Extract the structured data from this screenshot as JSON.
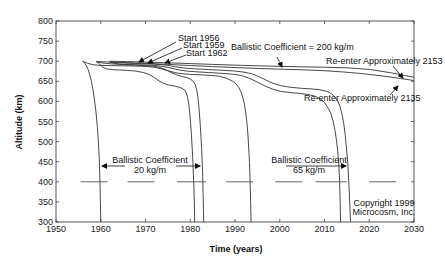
{
  "chart_data": {
    "type": "line",
    "title": "",
    "xlabel": "Time (years)",
    "ylabel": "Altitude (km)",
    "xlim": [
      1950,
      2030
    ],
    "ylim": [
      300,
      800
    ],
    "xticks": [
      1950,
      1960,
      1970,
      1980,
      1990,
      2000,
      2010,
      2020,
      2030
    ],
    "yticks": [
      300,
      350,
      400,
      450,
      500,
      550,
      600,
      650,
      700,
      750,
      800
    ],
    "grid": false,
    "legend": null,
    "series": [
      {
        "name": "BC 20 kg/m, start 1956",
        "points": [
          [
            1956,
            700
          ],
          [
            1956.8,
            690
          ],
          [
            1957.5,
            670
          ],
          [
            1958.3,
            630
          ],
          [
            1959,
            570
          ],
          [
            1959.5,
            500
          ],
          [
            1959.8,
            420
          ],
          [
            1960,
            300
          ]
        ]
      },
      {
        "name": "BC 20 kg/m, start 1959",
        "points": [
          [
            1959,
            700
          ],
          [
            1960,
            690
          ],
          [
            1961,
            680
          ],
          [
            1964,
            678
          ],
          [
            1968,
            676
          ],
          [
            1971,
            668
          ],
          [
            1973,
            650
          ],
          [
            1975,
            640
          ],
          [
            1978,
            636
          ],
          [
            1979.5,
            620
          ],
          [
            1980.3,
            520
          ],
          [
            1980.8,
            400
          ],
          [
            1981,
            300
          ]
        ]
      },
      {
        "name": "BC 20 kg/m, start 1962",
        "points": [
          [
            1962,
            698
          ],
          [
            1964,
            692
          ],
          [
            1968,
            690
          ],
          [
            1972,
            688
          ],
          [
            1974,
            682
          ],
          [
            1976,
            670
          ],
          [
            1978,
            662
          ],
          [
            1980,
            658
          ],
          [
            1981.5,
            640
          ],
          [
            1982.3,
            540
          ],
          [
            1982.8,
            420
          ],
          [
            1983,
            300
          ]
        ]
      },
      {
        "name": "BC 65 kg/m, start 1956",
        "points": [
          [
            1956,
            700
          ],
          [
            1958,
            690
          ],
          [
            1962,
            689
          ],
          [
            1968,
            688
          ],
          [
            1972,
            686
          ],
          [
            1975,
            676
          ],
          [
            1978,
            668
          ],
          [
            1985,
            665
          ],
          [
            1988,
            660
          ],
          [
            1991,
            640
          ],
          [
            1992.5,
            580
          ],
          [
            1993.3,
            450
          ],
          [
            1993.6,
            300
          ]
        ]
      },
      {
        "name": "BC 65 kg/m, start 1959",
        "points": [
          [
            1959,
            698
          ],
          [
            1962,
            693
          ],
          [
            1968,
            691
          ],
          [
            1972,
            690
          ],
          [
            1975,
            685
          ],
          [
            1978,
            676
          ],
          [
            1984,
            672
          ],
          [
            1990,
            668
          ],
          [
            1993,
            660
          ],
          [
            1997,
            636
          ],
          [
            2000,
            624
          ],
          [
            2005,
            620
          ],
          [
            2008,
            614
          ],
          [
            2010,
            600
          ],
          [
            2012,
            560
          ],
          [
            2013.3,
            450
          ],
          [
            2013.6,
            300
          ]
        ]
      },
      {
        "name": "BC 65 kg/m, start 1962",
        "points": [
          [
            1962,
            697
          ],
          [
            1968,
            694
          ],
          [
            1972,
            693
          ],
          [
            1975,
            690
          ],
          [
            1978,
            683
          ],
          [
            1984,
            679
          ],
          [
            1990,
            676
          ],
          [
            1994,
            670
          ],
          [
            1997,
            652
          ],
          [
            2000,
            638
          ],
          [
            2005,
            632
          ],
          [
            2009,
            630
          ],
          [
            2012,
            620
          ],
          [
            2014,
            580
          ],
          [
            2015.3,
            450
          ],
          [
            2015.8,
            300
          ]
        ]
      },
      {
        "name": "BC 200 kg/m, upper (re-enter ~2153)",
        "points": [
          [
            1962,
            700
          ],
          [
            1970,
            698
          ],
          [
            1980,
            694
          ],
          [
            1990,
            690
          ],
          [
            2000,
            687
          ],
          [
            2010,
            685
          ],
          [
            2020,
            682
          ],
          [
            2030,
            660
          ]
        ]
      },
      {
        "name": "BC 200 kg/m, lower (re-enter ~2135)",
        "points": [
          [
            1959,
            699
          ],
          [
            1970,
            695
          ],
          [
            1980,
            689
          ],
          [
            1990,
            684
          ],
          [
            2000,
            680
          ],
          [
            2010,
            677
          ],
          [
            2018,
            670
          ],
          [
            2024,
            662
          ],
          [
            2030,
            652
          ]
        ]
      }
    ],
    "annotations": [
      {
        "text": "Start 1956",
        "x": 1962,
        "y": 722
      },
      {
        "text": "Start 1959",
        "x": 1964,
        "y": 711
      },
      {
        "text": "Start 1962",
        "x": 1967,
        "y": 700
      },
      {
        "text": "Ballistic Coefficient = 200 kg/m",
        "x": 1982,
        "y": 717
      },
      {
        "text": "Re-enter Approximately 2153",
        "x": 1998,
        "y": 689
      },
      {
        "text": "Re-enter Approximately 2135",
        "x": 2000,
        "y": 615
      },
      {
        "text": "Ballistic Coefficient",
        "x": 1967,
        "y": 438
      },
      {
        "text": "20 kg/m",
        "x": 1967,
        "y": 425
      },
      {
        "text": "Ballistic Coefficient",
        "x": 2002,
        "y": 438
      },
      {
        "text": "65 kg/m",
        "x": 2002,
        "y": 425
      },
      {
        "text": "Copyright 1999",
        "x": 2025,
        "y": 335
      },
      {
        "text": "Microcosm, Inc.",
        "x": 2025,
        "y": 322
      }
    ],
    "reference_dashes_y": 400
  },
  "labels": {
    "xlabel": "Time (years)",
    "ylabel": "Altitude (km)",
    "start_1956": "Start 1956",
    "start_1959": "Start 1959",
    "start_1962": "Start 1962",
    "bc_200": "Ballistic Coefficient = 200 kg/m",
    "reenter_2153": "Re-enter Approximately 2153",
    "reenter_2135": "Re-enter Approximately 2135",
    "bc_label": "Ballistic Coefficient",
    "bc_20": "20 kg/m",
    "bc_65": "65 kg/m",
    "copyright_1": "Copyright 1999",
    "copyright_2": "Microcosm, Inc."
  }
}
